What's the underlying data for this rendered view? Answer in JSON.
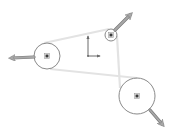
{
  "viewport": {
    "width": 175,
    "height": 133,
    "background": "#ffffff"
  },
  "colors": {
    "circle_stroke": "#8a8a8a",
    "belt_line": "#e3e3e3",
    "center_point": "#3a3a3a",
    "arrow_fill": "#a8a8a8",
    "arrow_stroke": "#7a7a7a",
    "origin": "#6a6a6a"
  },
  "sketch": {
    "circles": [
      {
        "id": "left-pulley",
        "cx": 47,
        "cy": 56,
        "r": 13
      },
      {
        "id": "top-pulley",
        "cx": 111,
        "cy": 35,
        "r": 6
      },
      {
        "id": "bottom-right-pulley",
        "cx": 137,
        "cy": 96,
        "r": 18
      }
    ],
    "belt_segments": [
      {
        "x1": 44,
        "y1": 43,
        "x2": 109,
        "y2": 29
      },
      {
        "x1": 50,
        "y1": 69,
        "x2": 137,
        "y2": 78
      },
      {
        "x1": 117,
        "y1": 36,
        "x2": 120,
        "y2": 88
      }
    ],
    "drag_arrows": [
      {
        "id": "left-arrow",
        "x1": 34,
        "y1": 57,
        "x2": 12,
        "y2": 58
      },
      {
        "id": "top-arrow",
        "x1": 115,
        "y1": 30,
        "x2": 130,
        "y2": 15
      },
      {
        "id": "bottom-arrow",
        "x1": 150,
        "y1": 110,
        "x2": 162,
        "y2": 124
      }
    ],
    "origin": {
      "x": 88,
      "y": 56,
      "axis_len_y": 20,
      "axis_len_x": 12
    }
  }
}
